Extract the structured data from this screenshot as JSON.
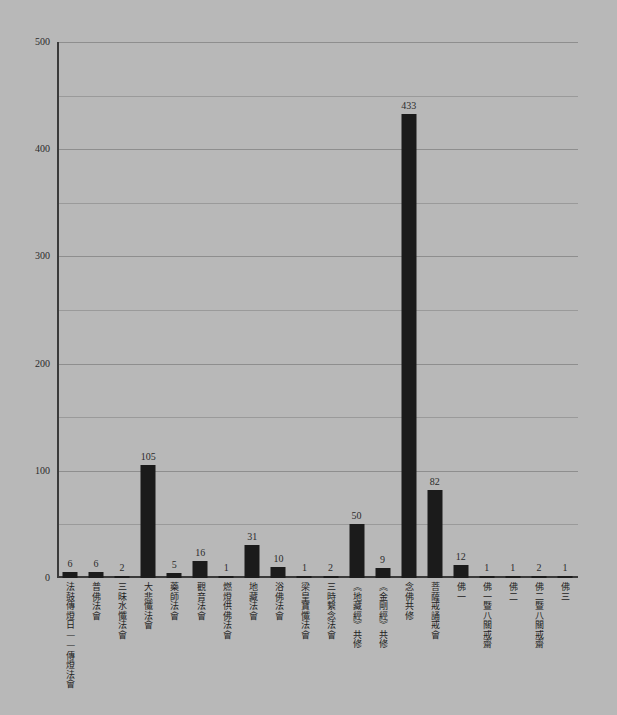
{
  "chart_data": {
    "type": "bar",
    "title": "",
    "subtitle": "",
    "xlabel": "",
    "ylabel": "",
    "ylim": [
      0,
      500
    ],
    "grid": true,
    "legend": null,
    "orientation": "vertical",
    "bar_color": "#1b1b1b",
    "background_color": "#b8b8b8",
    "y_major_ticks": [
      0,
      100,
      200,
      300,
      400,
      500
    ],
    "y_gridline_values": [
      50,
      100,
      150,
      200,
      250,
      300,
      350,
      400,
      450,
      500
    ],
    "y_tick_labels": [
      "0",
      "100",
      "200",
      "300",
      "400",
      "500"
    ],
    "categories": [
      "法鼓傳燈日——傳燈法會",
      "普佛法會",
      "三昧水懺法會",
      "大悲懺法會",
      "藥師法會",
      "觀音法會",
      "燃燈供佛法會",
      "地藏法會",
      "浴佛法會",
      "梁皇寶懺法會",
      "三時繫念法會",
      "《地藏經》共修",
      "《金剛經》共修",
      "念佛共修",
      "菩薩戒誦戒會",
      "佛一",
      "佛一暨八關戒齋",
      "佛二",
      "佛二暨八關戒齋",
      "佛三"
    ],
    "values": [
      6,
      6,
      2,
      105,
      5,
      16,
      1,
      31,
      10,
      1,
      2,
      50,
      9,
      433,
      82,
      12,
      1,
      1,
      2,
      1
    ],
    "value_labels": [
      "6",
      "6",
      "2",
      "105",
      "5",
      "16",
      "1",
      "31",
      "10",
      "1",
      "2",
      "50",
      "9",
      "433",
      "82",
      "12",
      "1",
      "1",
      "2",
      "1"
    ]
  }
}
